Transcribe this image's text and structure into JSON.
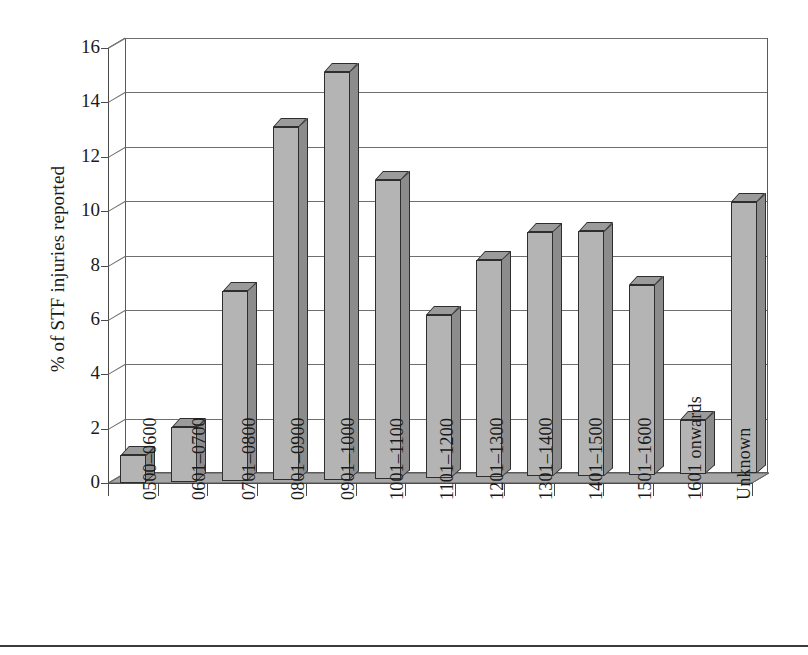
{
  "figure": {
    "ylabel": "% of STF injuries reported"
  },
  "chart_data": {
    "type": "bar",
    "title": "",
    "xlabel": "",
    "ylabel": "% of STF injuries reported",
    "ylim": [
      0,
      16
    ],
    "ytick_labels": [
      "0",
      "2",
      "4",
      "6",
      "8",
      "10",
      "12",
      "14",
      "16"
    ],
    "ytick_values": [
      0,
      2,
      4,
      6,
      8,
      10,
      12,
      14,
      16
    ],
    "grid": true,
    "legend": "none",
    "style": "3d-column",
    "categories": [
      "0500–0600",
      "0601–0700",
      "0701–0800",
      "0801–0900",
      "0901–1000",
      "1001–1100",
      "1101–1200",
      "1201–1300",
      "1301–1400",
      "1401–1500",
      "1501–1600",
      "1601 onwards",
      "Unknown"
    ],
    "values": [
      1,
      2,
      7,
      13,
      15,
      11,
      6,
      8,
      9,
      9,
      7,
      2,
      10
    ],
    "colors": {
      "bar_front": "#b4b4b4",
      "bar_side": "#8c8c8c",
      "bar_top": "#9b9b9b",
      "bar_outline": "#2e2e2e",
      "floor": "#a6a6a6",
      "gridline": "#6f6f6f",
      "axis": "#4a4a4a",
      "text": "#1a1a1a",
      "background": "#ffffff"
    }
  }
}
